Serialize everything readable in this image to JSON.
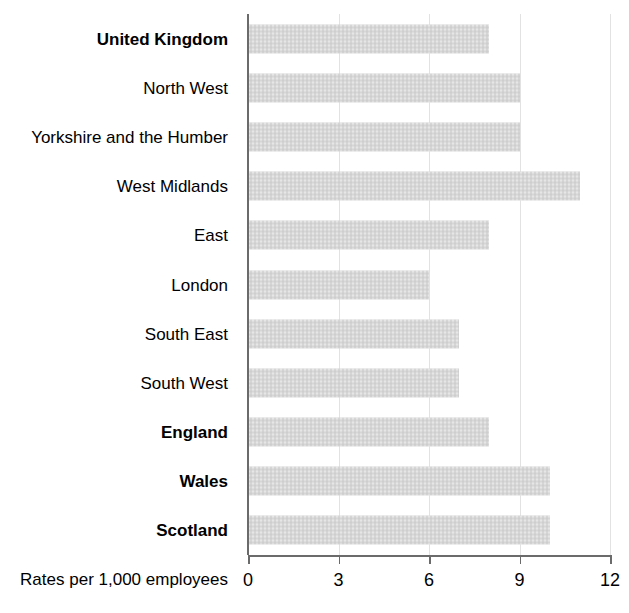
{
  "chart_data": {
    "type": "bar",
    "orientation": "horizontal",
    "title": "",
    "subtitle": "",
    "xlabel": "Rates per 1,000 employees",
    "ylabel": "",
    "xlim": [
      0,
      12
    ],
    "xticks": [
      0,
      3,
      6,
      9,
      12
    ],
    "xtick_labels": [
      "0",
      "3",
      "6",
      "9",
      "12"
    ],
    "grid": true,
    "grid_axis": "x",
    "legend": false,
    "legend_position": "none",
    "bar_color": "#d6d6d6",
    "axis_color": "#6b6b6b",
    "gridline_color": "#e2e2e2",
    "categories": [
      "United Kingdom",
      "North West",
      "Yorkshire and the Humber",
      "West Midlands",
      "East",
      "London",
      "South East",
      "South West",
      "England",
      "Wales",
      "Scotland"
    ],
    "values": [
      8,
      9,
      9,
      11,
      8,
      6,
      7,
      7,
      8,
      10,
      10
    ],
    "emphasis": [
      true,
      false,
      false,
      false,
      false,
      false,
      false,
      false,
      true,
      true,
      true
    ]
  }
}
